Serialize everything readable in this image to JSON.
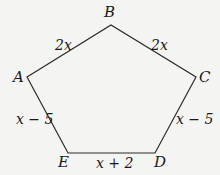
{
  "diagram": {
    "type": "pentagon",
    "stroke_color": "#2a2a2a",
    "background": "#f4f4f2",
    "vertices": [
      {
        "name": "A",
        "x": 27,
        "y": 77
      },
      {
        "name": "B",
        "x": 111,
        "y": 25
      },
      {
        "name": "C",
        "x": 196,
        "y": 77
      },
      {
        "name": "D",
        "x": 155,
        "y": 153
      },
      {
        "name": "E",
        "x": 68,
        "y": 153
      }
    ],
    "vertex_labels": {
      "A": "A",
      "B": "B",
      "C": "C",
      "D": "D",
      "E": "E"
    },
    "side_labels": {
      "AB": "2x",
      "BC": "2x",
      "CD": "x − 5",
      "DE": "x + 2",
      "EA": "x − 5"
    }
  }
}
